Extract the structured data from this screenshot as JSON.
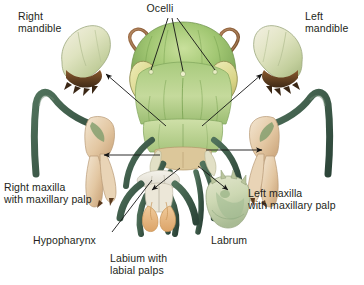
{
  "figure": {
    "background_color": "#ffffff",
    "width": 364,
    "height": 285
  },
  "palette": {
    "label_text": "#231f20",
    "leader_line": "#1a1a1a",
    "head_green_light": "#b9d18a",
    "head_green_mid": "#8fbc63",
    "head_green_dark": "#5d8f43",
    "eye_yellow": "#ddd98a",
    "antenna_brown": "#8a5a34",
    "mandible_cream": "#e9e7cf",
    "mandible_green": "#c9d6a4",
    "mandible_tooth_brown": "#6b4423",
    "maxilla_tan": "#e7cfae",
    "palp_dark_green": "#3c5f4a",
    "labium_orange": "#e8b57f",
    "labrum_pale": "#d8dcc0",
    "hypopharynx_white": "#ece9e0"
  },
  "labels": [
    {
      "id": "right-mandible",
      "text": "Right\nmandible",
      "align": "left",
      "x": 18,
      "y": 10
    },
    {
      "id": "ocelli",
      "text": "Ocelli",
      "align": "center",
      "x": 160,
      "y": 3
    },
    {
      "id": "left-mandible",
      "text": "Left\nmandible",
      "align": "left",
      "x": 305,
      "y": 10
    },
    {
      "id": "right-maxilla",
      "text": "Right maxilla\nwith maxillary palp",
      "align": "left",
      "x": 4,
      "y": 180
    },
    {
      "id": "left-maxilla",
      "text": "Left maxilla\nwith maxillary palp",
      "align": "left",
      "x": 248,
      "y": 186
    },
    {
      "id": "hypopharynx",
      "text": "Hypopharynx",
      "align": "left",
      "x": 33,
      "y": 234
    },
    {
      "id": "labium",
      "text": "Labium with\nlabial palps",
      "align": "left",
      "x": 110,
      "y": 252
    },
    {
      "id": "labrum",
      "text": "Labrum",
      "align": "left",
      "x": 211,
      "y": 234
    }
  ],
  "parts": [
    {
      "id": "head",
      "name": "grasshopper-head",
      "label_ref": "ocelli"
    },
    {
      "id": "right-mandible",
      "name": "right-mandible",
      "label_ref": "right-mandible"
    },
    {
      "id": "left-mandible",
      "name": "left-mandible",
      "label_ref": "left-mandible"
    },
    {
      "id": "right-maxilla",
      "name": "right-maxilla",
      "label_ref": "right-maxilla"
    },
    {
      "id": "left-maxilla",
      "name": "left-maxilla",
      "label_ref": "left-maxilla"
    },
    {
      "id": "hypopharynx",
      "name": "hypopharynx",
      "label_ref": "hypopharynx"
    },
    {
      "id": "labium",
      "name": "labium",
      "label_ref": "labium"
    },
    {
      "id": "labrum",
      "name": "labrum",
      "label_ref": "labrum"
    }
  ],
  "leaders": [
    {
      "id": "ocelli-left",
      "kind": "line",
      "from": [
        168,
        18
      ],
      "to": [
        150,
        72
      ]
    },
    {
      "id": "ocelli-middle",
      "kind": "line",
      "from": [
        172,
        18
      ],
      "to": [
        173,
        70
      ]
    },
    {
      "id": "ocelli-right",
      "kind": "line",
      "from": [
        176,
        18
      ],
      "to": [
        196,
        72
      ]
    },
    {
      "id": "head-to-rmandible",
      "kind": "arrow",
      "from": [
        164,
        122
      ],
      "to": [
        105,
        72
      ]
    },
    {
      "id": "head-to-lmandible",
      "kind": "arrow",
      "from": [
        205,
        122
      ],
      "to": [
        262,
        72
      ]
    },
    {
      "id": "head-to-rmaxilla",
      "kind": "arrow",
      "from": [
        158,
        154
      ],
      "to": [
        100,
        154
      ]
    },
    {
      "id": "head-to-lmaxilla",
      "kind": "arrow",
      "from": [
        212,
        152
      ],
      "to": [
        268,
        152
      ]
    },
    {
      "id": "head-to-labium",
      "kind": "arrow",
      "from": [
        178,
        168
      ],
      "to": [
        150,
        190
      ]
    },
    {
      "id": "head-to-labrum",
      "kind": "arrow",
      "from": [
        196,
        166
      ],
      "to": [
        228,
        188
      ]
    },
    {
      "id": "hypopharynx-leader",
      "kind": "line",
      "from": [
        112,
        232
      ],
      "to": [
        150,
        178
      ]
    },
    {
      "id": "labrum-dot-leader",
      "kind": "arrow",
      "from": [
        203,
        178
      ],
      "to": [
        222,
        192
      ]
    }
  ]
}
